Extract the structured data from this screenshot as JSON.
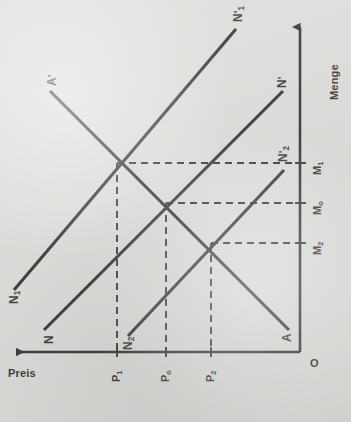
{
  "figure": {
    "type": "supply-demand-diagram",
    "language": "de",
    "background_color": "#d9d9d6",
    "ink_color": "#151515"
  },
  "axes": {
    "vertical": {
      "name": "menge-axis",
      "label": "Menge",
      "direction": "up",
      "arrowhead": true,
      "x_px": 300,
      "y_top_px": 22,
      "y_bottom_px": 352
    },
    "horizontal": {
      "name": "preis-axis",
      "label": "Preis",
      "direction": "left",
      "arrowhead": true,
      "y_px": 352,
      "x_left_px": 14,
      "x_right_px": 300
    },
    "origin": {
      "label": "O",
      "x_px": 300,
      "y_px": 352
    }
  },
  "tick_labels": {
    "price_axis": [
      {
        "id": "P1",
        "base": "P",
        "sub": "1",
        "x_px": 117
      },
      {
        "id": "P0",
        "base": "P",
        "sub": "o",
        "x_px": 166
      },
      {
        "id": "P2",
        "base": "P",
        "sub": "2",
        "x_px": 211
      }
    ],
    "quantity_axis": [
      {
        "id": "M1",
        "base": "M",
        "sub": "1",
        "y_px": 163
      },
      {
        "id": "M0",
        "base": "M",
        "sub": "o",
        "y_px": 203
      },
      {
        "id": "M2",
        "base": "M",
        "sub": "2",
        "y_px": 243
      }
    ]
  },
  "curves": [
    {
      "name": "supply-curve-N",
      "label": "N",
      "label_base": "N",
      "label_prime": "",
      "label_sub": "",
      "slope": "rising",
      "x1": 44,
      "y1": 330,
      "x2": 283,
      "y2": 90,
      "label_x": 47,
      "label_y": 342
    },
    {
      "name": "supply-curve-N-prime",
      "label": "N'",
      "label_base": "N",
      "label_prime": "'",
      "label_sub": "",
      "slope": "rising",
      "x1": 44,
      "y1": 330,
      "x2": 283,
      "y2": 90,
      "label_x": 278,
      "label_y": 78
    },
    {
      "name": "supply-curve-N1",
      "label": "N1'",
      "label_base": "N",
      "label_prime": "'",
      "label_sub": "1",
      "slope": "rising",
      "x1": 14,
      "y1": 290,
      "x2": 235,
      "y2": 29,
      "label_x": 12,
      "label_y": 302
    },
    {
      "name": "supply-curve-N2",
      "label": "N2'",
      "label_base": "N",
      "label_prime": "'",
      "label_sub": "2",
      "slope": "rising",
      "x1": 128,
      "y1": 336,
      "x2": 283,
      "y2": 170,
      "label_x": 126,
      "label_y": 348
    },
    {
      "name": "demand-curve-A",
      "label": "A'",
      "label_base": "A",
      "label_prime": "'",
      "label_sub": "",
      "slope": "falling",
      "x1": 49,
      "y1": 90,
      "x2": 288,
      "y2": 330,
      "label_x": 48,
      "label_y": 78
    },
    {
      "name": "demand-curve-A-end",
      "label": "A",
      "label_base": "A",
      "label_prime": "",
      "label_sub": "",
      "slope": "falling",
      "x1": 49,
      "y1": 90,
      "x2": 288,
      "y2": 330,
      "label_x": 283,
      "label_y": 342
    }
  ],
  "equilibria": [
    {
      "name": "equilibrium-1",
      "price": "P1",
      "quantity": "M1",
      "x_px": 117,
      "y_px": 163
    },
    {
      "name": "equilibrium-0",
      "price": "Po",
      "quantity": "Mo",
      "x_px": 166,
      "y_px": 203
    },
    {
      "name": "equilibrium-2",
      "price": "P2",
      "quantity": "M2",
      "x_px": 211,
      "y_px": 243
    }
  ],
  "guides": {
    "style": "dashed",
    "horizontal_to_axis": true,
    "vertical_to_axis": true
  }
}
